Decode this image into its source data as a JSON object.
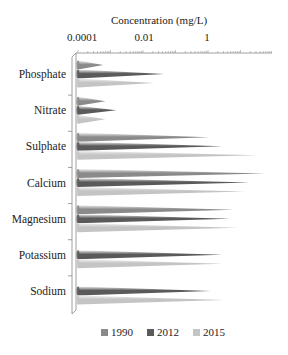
{
  "chart_data": {
    "type": "bar",
    "orientation": "horizontal",
    "style": "3d-cone",
    "title": "Concentration (mg/L)",
    "xlabel": "Concentration (mg/L)",
    "ylabel": "",
    "xscale": "log",
    "xlim": [
      0.0001,
      100
    ],
    "x_tick_labels": [
      "0.0001",
      "0.01",
      "1"
    ],
    "categories": [
      "Phosphate",
      "Nitrate",
      "Sulphate",
      "Calcium",
      "Magnesium",
      "Potassium",
      "Sodium"
    ],
    "series": [
      {
        "name": "1990",
        "color": "#8a8a8a",
        "values": [
          0.0006,
          0.0007,
          1.1,
          56,
          6.3,
          null,
          null
        ]
      },
      {
        "name": "2012",
        "color": "#5a5a5a",
        "values": [
          0.045,
          0.0015,
          2.7,
          19.5,
          4.7,
          2.7,
          1.2
        ]
      },
      {
        "name": "2015",
        "color": "#c4c4c4",
        "values": [
          0.022,
          0.0007,
          32,
          13.6,
          8,
          2.7,
          3.3
        ]
      }
    ],
    "legend_position": "bottom",
    "grid": false
  },
  "legend": [
    {
      "label": "1990",
      "color": "#8a8a8a"
    },
    {
      "label": "2012",
      "color": "#5a5a5a"
    },
    {
      "label": "2015",
      "color": "#c4c4c4"
    }
  ]
}
